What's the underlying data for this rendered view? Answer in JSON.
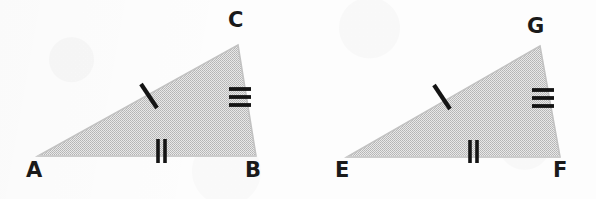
{
  "figure": {
    "kind": "geometry-diagram",
    "background_color": "#fdfdfd",
    "fill_color": "#d2d2d2",
    "edge_color": "#b9b9b9",
    "tick_color": "#141414",
    "label_color": "#1a1a1a"
  },
  "shapes": [
    {
      "id": "triangle-abc",
      "name": "triangle-abc",
      "points": "38,156 238,45 256,156",
      "vertices": [
        {
          "label": "A",
          "x": 38,
          "y": 156,
          "label_x": 26,
          "label_y": 160
        },
        {
          "label": "C",
          "x": 238,
          "y": 45,
          "label_x": 228,
          "label_y": 10
        },
        {
          "label": "B",
          "x": 256,
          "y": 156,
          "label_x": 245,
          "label_y": 160
        }
      ],
      "ticks": [
        {
          "name": "single-tick-side-ac",
          "count": 1,
          "side": "AC",
          "x": 148,
          "y": 96,
          "angle": -55
        },
        {
          "name": "double-tick-side-ab",
          "count": 2,
          "side": "AB",
          "x": 161,
          "y": 151,
          "angle": 0
        },
        {
          "name": "triple-tick-side-cb",
          "count": 3,
          "side": "CB",
          "x": 240,
          "y": 97,
          "angle": 90
        }
      ]
    },
    {
      "id": "triangle-efg",
      "name": "triangle-efg",
      "points": "347,157 540,46 560,157",
      "vertices": [
        {
          "label": "E",
          "x": 347,
          "y": 157,
          "label_x": 335,
          "label_y": 160
        },
        {
          "label": "G",
          "x": 540,
          "y": 46,
          "label_x": 527,
          "label_y": 16
        },
        {
          "label": "F",
          "x": 560,
          "y": 157,
          "label_x": 553,
          "label_y": 160
        }
      ],
      "ticks": [
        {
          "name": "single-tick-side-eg",
          "count": 1,
          "side": "EG",
          "x": 442,
          "y": 97,
          "angle": -55
        },
        {
          "name": "double-tick-side-ef",
          "count": 2,
          "side": "EF",
          "x": 473,
          "y": 151,
          "angle": 0
        },
        {
          "name": "triple-tick-side-gf",
          "count": 3,
          "side": "GF",
          "x": 543,
          "y": 98,
          "angle": 90
        }
      ]
    }
  ],
  "labels": {
    "a": "A",
    "b": "B",
    "c": "C",
    "e": "E",
    "f": "F",
    "g": "G"
  }
}
